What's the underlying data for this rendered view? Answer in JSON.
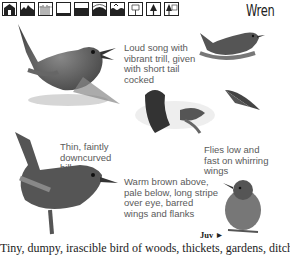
{
  "header": {
    "title": "Wren",
    "habitat_icons": [
      {
        "name": "house-icon"
      },
      {
        "name": "farmland-icon"
      },
      {
        "name": "reedbed-icon"
      },
      {
        "name": "open-ground-icon"
      },
      {
        "name": "water-icon"
      },
      {
        "name": "hill-icon"
      },
      {
        "name": "coast-icon"
      },
      {
        "name": "deciduous-tree-icon"
      },
      {
        "name": "conifer-tree-icon"
      },
      {
        "name": "mixed-woodland-icon"
      }
    ]
  },
  "captions": {
    "song": "Loud song with vibrant trill, given with short tail cocked",
    "bill": "Thin, faintly downcurved bill",
    "flight": "Flies low and fast on whirring wings",
    "plumage": "Warm brown above, pale below, long stripe over eye, barred wings and flanks",
    "juvenile_label": "Juv ►"
  },
  "body_text": "Tiny, dumpy, irascible bird of woods, thickets, gardens, ditches"
}
